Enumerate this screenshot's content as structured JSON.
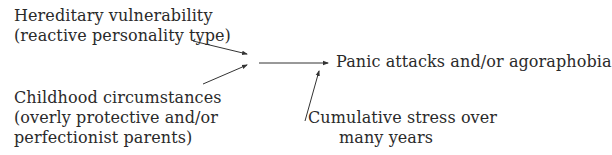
{
  "diagram": {
    "nodes": {
      "hereditary": {
        "line1": "Hereditary vulnerability",
        "line2": "(reactive personality type)"
      },
      "childhood": {
        "line1": "Childhood circumstances",
        "line2": "(overly protective and/or",
        "line3": "perfectionist parents)"
      },
      "outcome": {
        "line1": "Panic attacks and/or agoraphobia"
      },
      "stress": {
        "line1": "Cumulative stress over",
        "line2": "many years"
      }
    },
    "edges": [
      {
        "from": "hereditary",
        "to": "junction"
      },
      {
        "from": "childhood",
        "to": "junction"
      },
      {
        "from": "junction",
        "to": "outcome"
      },
      {
        "from": "stress",
        "to": "outcome"
      }
    ],
    "colors": {
      "text": "#2a2a2a",
      "line": "#333333",
      "background": "#ffffff"
    }
  }
}
